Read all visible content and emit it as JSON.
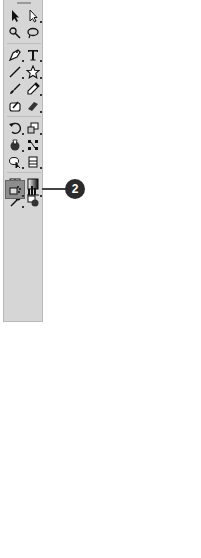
{
  "toolbar": {
    "tools": [
      {
        "name": "selection-tool",
        "icon": "arrow"
      },
      {
        "name": "direct-selection-tool",
        "icon": "white-arrow"
      },
      {
        "name": "magic-wand-tool",
        "icon": "wand"
      },
      {
        "name": "lasso-tool",
        "icon": "lasso"
      },
      {
        "name": "pen-tool",
        "icon": "pen"
      },
      {
        "name": "type-tool",
        "icon": "T"
      },
      {
        "name": "line-segment-tool",
        "icon": "line"
      },
      {
        "name": "star-tool",
        "icon": "star"
      },
      {
        "name": "paintbrush-tool",
        "icon": "brush"
      },
      {
        "name": "pencil-tool",
        "icon": "pencil"
      },
      {
        "name": "blob-brush-tool",
        "icon": "blob"
      },
      {
        "name": "eraser-tool",
        "icon": "eraser"
      },
      {
        "name": "rotate-tool",
        "icon": "rotate"
      },
      {
        "name": "scale-tool",
        "icon": "scale"
      },
      {
        "name": "warp-tool",
        "icon": "warp"
      },
      {
        "name": "free-transform-tool",
        "icon": "free-transform"
      },
      {
        "name": "shape-builder-tool",
        "icon": "shape-builder"
      },
      {
        "name": "perspective-grid-tool",
        "icon": "perspective"
      },
      {
        "name": "mesh-tool",
        "icon": "mesh"
      },
      {
        "name": "gradient-tool",
        "icon": "gradient"
      },
      {
        "name": "eyedropper-tool",
        "icon": "eyedropper"
      },
      {
        "name": "blend-tool",
        "icon": "blend"
      },
      {
        "name": "symbol-sprayer-tool",
        "icon": "symbol-sprayer",
        "selected": true
      },
      {
        "name": "column-graph-tool",
        "icon": "graph"
      },
      {
        "name": "artboard-tool",
        "icon": "artboard"
      },
      {
        "name": "slice-tool",
        "icon": "slice"
      },
      {
        "name": "hand-tool",
        "icon": "hand"
      },
      {
        "name": "zoom-tool",
        "icon": "zoom"
      }
    ],
    "fill_label": "?",
    "colors": {
      "panel": "#d6d6d6",
      "selected": "#8d8d8d"
    }
  },
  "callouts": [
    {
      "number": "1",
      "target": "artboard-top"
    },
    {
      "number": "2",
      "target": "symbol-sprayer-tool"
    },
    {
      "number": "3",
      "target": "artboard-right"
    }
  ],
  "canvas": {
    "bird_color": "#7a7a7a",
    "bird_count": 11
  }
}
